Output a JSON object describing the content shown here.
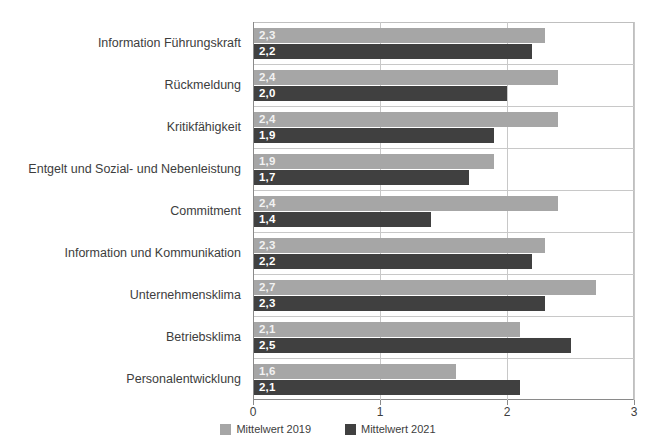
{
  "chart_data": {
    "type": "bar",
    "orientation": "horizontal",
    "title": "",
    "xlabel": "",
    "ylabel": "",
    "xlim": [
      0,
      3
    ],
    "xticks": [
      "0",
      "1",
      "2",
      "3"
    ],
    "grid": true,
    "legend_position": "bottom",
    "categories": [
      "Information Führungskraft",
      "Rückmeldung",
      "Kritikfähigkeit",
      "Entgelt und Sozial- und Nebenleistung",
      "Commitment",
      "Information und Kommunikation",
      "Unternehmensklima",
      "Betriebsklima",
      "Personalentwicklung"
    ],
    "series": [
      {
        "name": "Mittelwert 2019",
        "color": "#a6a6a6",
        "values": [
          2.3,
          2.4,
          2.4,
          1.9,
          2.4,
          2.3,
          2.7,
          2.1,
          1.6
        ],
        "labels": [
          "2,3",
          "2,4",
          "2,4",
          "1,9",
          "2,4",
          "2,3",
          "2,7",
          "2,1",
          "1,6"
        ]
      },
      {
        "name": "Mittelwert 2021",
        "color": "#404040",
        "values": [
          2.2,
          2.0,
          1.9,
          1.7,
          1.4,
          2.2,
          2.3,
          2.5,
          2.1
        ],
        "labels": [
          "2,2",
          "2,0",
          "1,9",
          "1,7",
          "1,4",
          "2,2",
          "2,3",
          "2,5",
          "2,1"
        ]
      }
    ]
  }
}
